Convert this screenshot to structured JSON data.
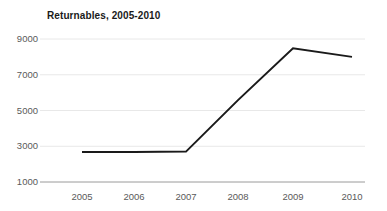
{
  "chart_data": {
    "type": "line",
    "title": "Returnables, 2005-2010",
    "xlabel": "",
    "ylabel": "",
    "categories": [
      "2005",
      "2006",
      "2007",
      "2008",
      "2009",
      "2010"
    ],
    "series": [
      {
        "name": "Returnables",
        "values": [
          2680,
          2680,
          2700,
          5580,
          8480,
          8000
        ],
        "color": "#1a1a1a"
      }
    ],
    "ylim": [
      1000,
      9000
    ],
    "y_ticks": [
      1000,
      3000,
      5000,
      7000,
      9000
    ],
    "y_tick_labels": [
      "1000",
      "3000",
      "5000",
      "7000",
      "9000"
    ],
    "x_tick_labels": [
      "2005",
      "2006",
      "2007",
      "2008",
      "2009",
      "2010"
    ],
    "grid": true,
    "grid_color": "#e8e8e8",
    "axis_color": "#9a9a9a",
    "legend": false,
    "legend_position": "none",
    "background": "#ffffff",
    "tick_label_color": "#5a5a5a",
    "title_color": "#1a1a1a",
    "line_width": 2
  },
  "layout": {
    "plot_left": 47,
    "plot_right": 365,
    "plot_top": 39,
    "plot_bottom": 182,
    "x_positions": [
      82,
      134,
      186,
      238,
      293,
      352
    ],
    "y_positions_for_ticks": [
      182,
      146.25,
      110.5,
      74.75,
      39
    ]
  }
}
